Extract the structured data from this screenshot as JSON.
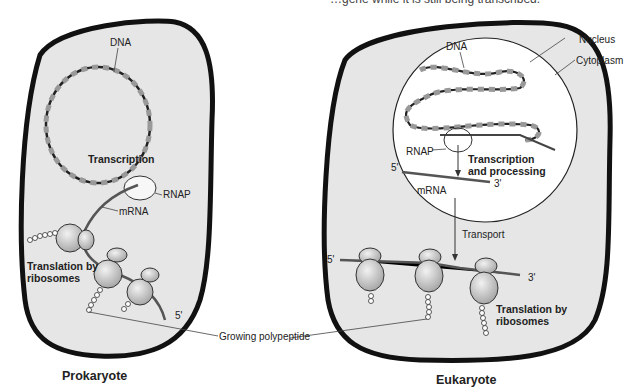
{
  "caption_truncated": "…gene while it is still being transcribed.",
  "prokaryote": {
    "title": "Prokaryote",
    "labels": {
      "dna": "DNA",
      "transcription": "Transcription",
      "rnap": "RNAP",
      "mrna": "mRNA",
      "translation_line1": "Translation by",
      "translation_line2": "ribosomes",
      "five_prime": "5'"
    }
  },
  "eukaryote": {
    "title": "Eukaryote",
    "labels": {
      "dna": "DNA",
      "nucleus": "Nucleus",
      "cytoplasm": "Cytoplasm",
      "rnap": "RNAP",
      "transcription_line1": "Transcription",
      "transcription_line2": "and processing",
      "five_prime_top": "5'",
      "three_prime_top": "3'",
      "mrna": "mRNA",
      "transport": "Transport",
      "five_prime_bottom": "5'",
      "three_prime_bottom": "3'",
      "translation_line1": "Translation by",
      "translation_line2": "ribosomes"
    }
  },
  "shared": {
    "growing_polypeptide": "Growing polypeptide"
  },
  "colors": {
    "cell_fill": "#e6e6e6",
    "cell_outline": "#111111",
    "nucleus_fill": "#ffffff",
    "ribosome_fill": "#c8c8c8",
    "mrna_stroke": "#555555"
  }
}
